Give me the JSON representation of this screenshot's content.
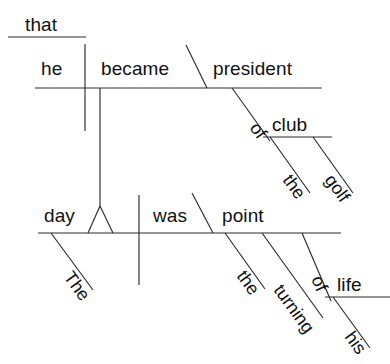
{
  "diagram": {
    "type": "reed-kellogg-sentence-diagram",
    "sentence": "The day that he became president of the golf club was the turning point of his life.",
    "ink_color": "#2b2b2b",
    "background_color": "#ffffff",
    "subordinate_clause": {
      "connector": {
        "label": "that"
      },
      "subject": {
        "label": "he"
      },
      "verb": {
        "label": "became"
      },
      "predicate_nominative": {
        "label": "president"
      },
      "prep_phrase": {
        "preposition": {
          "label": "of"
        },
        "object": {
          "label": "club"
        },
        "object_modifiers": [
          {
            "label": "the"
          },
          {
            "label": "golf"
          }
        ]
      }
    },
    "main_clause": {
      "subject": {
        "label": "day"
      },
      "subject_modifiers": [
        {
          "label": "The"
        }
      ],
      "verb": {
        "label": "was"
      },
      "predicate_nominative": {
        "label": "point"
      },
      "predicate_modifiers": [
        {
          "label": "the"
        },
        {
          "label": "turning"
        }
      ],
      "prep_phrase": {
        "preposition": {
          "label": "of"
        },
        "object": {
          "label": "life"
        },
        "object_modifiers": [
          {
            "label": "his"
          }
        ]
      }
    }
  }
}
